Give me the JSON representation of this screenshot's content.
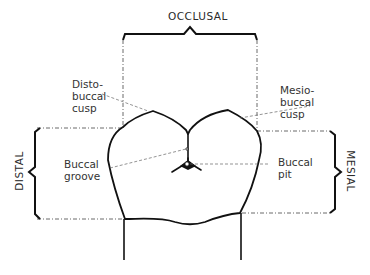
{
  "diagram": {
    "orientation_labels": {
      "top": "OCCLUSAL",
      "left": "DISTAL",
      "right": "MESIAL"
    },
    "annotations": {
      "disto_buccal_cusp": [
        "Disto-",
        "buccal",
        "cusp"
      ],
      "mesio_buccal_cusp": [
        "Mesio-",
        "buccal",
        "cusp"
      ],
      "buccal_groove": [
        "Buccal",
        "groove"
      ],
      "buccal_pit": [
        "Buccal",
        "pit"
      ]
    },
    "colors": {
      "outline": "#111111",
      "dashed": "#444444",
      "text": "#333333",
      "background": "#ffffff"
    }
  }
}
